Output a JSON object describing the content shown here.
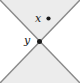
{
  "figure": {
    "width": 80,
    "height": 83,
    "background_color": "#ffffff",
    "border": "none",
    "labels": {
      "x_label": "x",
      "y_label": "y"
    },
    "points": [
      {
        "name": "x-point",
        "label": "x",
        "cx": 48.5,
        "cy": 18.5,
        "r": 2.1,
        "color": "#1a1a1a",
        "label_position": "left"
      },
      {
        "name": "y-point",
        "label": "y",
        "cx": 39.5,
        "cy": 41.5,
        "r": 2.4,
        "color": "#1a1a1a",
        "label_position": "left"
      }
    ],
    "lines": [
      {
        "name": "diagonal-down-right",
        "x1": 0,
        "y1": 0,
        "x2": 80,
        "y2": 83,
        "color": "#8a8a8a",
        "width": 1.6
      },
      {
        "name": "diagonal-down-left",
        "x1": 80,
        "y1": 0,
        "x2": 0,
        "y2": 83,
        "color": "#8a8a8a",
        "width": 1.6
      }
    ],
    "regions": [
      {
        "name": "upper-cone",
        "fill": "#eeeeee",
        "points": "0,0 80,0 39.5,41.5"
      },
      {
        "name": "lower-cone",
        "fill": "#eeeeee",
        "points": "0,83 80,83 39.5,41.5"
      },
      {
        "name": "left-region",
        "fill": "#ffffff",
        "points": "0,0 39.5,41.5 0,83"
      },
      {
        "name": "right-region",
        "fill": "#ffffff",
        "points": "80,0 39.5,41.5 80,83"
      }
    ],
    "colors": {
      "shading": "#eeeeee",
      "line": "#8a8a8a",
      "point": "#1a1a1a",
      "text": "#1a1a1a"
    }
  }
}
